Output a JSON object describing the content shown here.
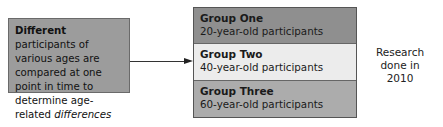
{
  "description_box": {
    "bold_lead": "Different",
    "text_part1": " participants of various ages are compared at one point in time to determine age-related ",
    "italic_end": "differences"
  },
  "groups": [
    {
      "name": "Group One",
      "desc": "20-year-old participants",
      "color": "#8f8f8f"
    },
    {
      "name": "Group Two",
      "desc": "40-year-old participants",
      "color": "#ececec"
    },
    {
      "name": "Group Three",
      "desc": "60-year-old participants",
      "color": "#acacac"
    }
  ],
  "side_note": {
    "line1": "Research",
    "line2": "done in",
    "line3": "2010"
  }
}
